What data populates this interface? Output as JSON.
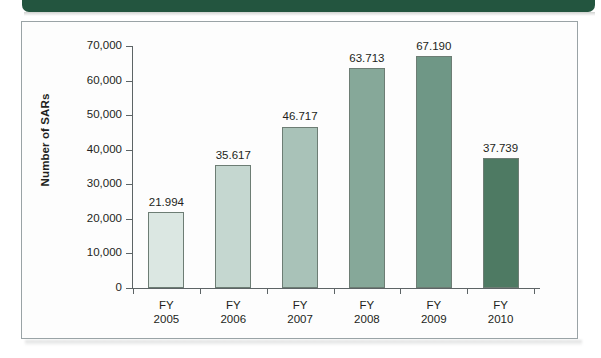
{
  "banner": {
    "color": "#23553f"
  },
  "chart_data": {
    "type": "bar",
    "title": "",
    "subtitle": "",
    "xlabel": "",
    "ylabel": "Number of SARs",
    "ylim": [
      0,
      70000
    ],
    "grid": false,
    "legend": "none",
    "y_ticks": [
      "0",
      "10,000",
      "20,000",
      "30,000",
      "40,000",
      "50,000",
      "60,000",
      "70,000"
    ],
    "y_tick_values": [
      0,
      10000,
      20000,
      30000,
      40000,
      50000,
      60000,
      70000
    ],
    "categories": [
      "FY 2005",
      "FY 2006",
      "FY 2007",
      "FY 2008",
      "FY 2009",
      "FY 2010"
    ],
    "category_lines": [
      [
        "FY",
        "2005"
      ],
      [
        "FY",
        "2006"
      ],
      [
        "FY",
        "2007"
      ],
      [
        "FY",
        "2008"
      ],
      [
        "FY",
        "2009"
      ],
      [
        "FY",
        "2010"
      ]
    ],
    "values": [
      21994,
      35617,
      46717,
      63713,
      67190,
      37739
    ],
    "data_labels": [
      "21.994",
      "35.617",
      "46.717",
      "63.713",
      "67.190",
      "37.739"
    ],
    "bar_colors": [
      "#dbe7e2",
      "#c5d7d0",
      "#a9c2b8",
      "#86a899",
      "#6f9786",
      "#4e7a63"
    ],
    "bar_border_color": "#6d7d74"
  }
}
